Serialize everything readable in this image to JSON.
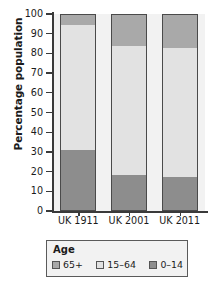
{
  "chart_data": {
    "type": "bar",
    "subtype": "stacked-bar-100",
    "title": "",
    "xlabel": "",
    "ylabel": "Percentage population",
    "categories": [
      "UK 1911",
      "UK 2001",
      "UK 2011"
    ],
    "ylim": [
      0,
      100
    ],
    "yticks": [
      0,
      10,
      20,
      30,
      40,
      50,
      60,
      70,
      80,
      90,
      100
    ],
    "ytick_labels": [
      "0",
      "10",
      "20",
      "30",
      "40",
      "50",
      "60",
      "70",
      "80",
      "90",
      "100"
    ],
    "grid": false,
    "legend_position": "bottom",
    "legend_title": "Age",
    "stack_order_bottom_to_top": [
      "0-14",
      "15-64",
      "65+"
    ],
    "series": [
      {
        "name": "65+",
        "color": "#a9a9a9",
        "values": [
          5,
          16,
          17
        ]
      },
      {
        "name": "15-64",
        "color": "#e2e2e2",
        "values": [
          64,
          66,
          66
        ]
      },
      {
        "name": "0-14",
        "color": "#8d8d8d",
        "values": [
          31,
          18,
          17
        ]
      }
    ]
  },
  "axis": {
    "y_title": "Percentage population"
  },
  "legend": {
    "title": "Age",
    "items": [
      {
        "label": "65+",
        "color": "#a9a9a9"
      },
      {
        "label": "15-64",
        "color": "#e2e2e2"
      },
      {
        "label": "0-14",
        "color": "#8d8d8d"
      }
    ]
  },
  "colors": {
    "plot_background": "#f2f2f2",
    "axis": "#3a3a3a",
    "bar_outline": "#4a4a4a",
    "text": "#1b1b1b"
  }
}
